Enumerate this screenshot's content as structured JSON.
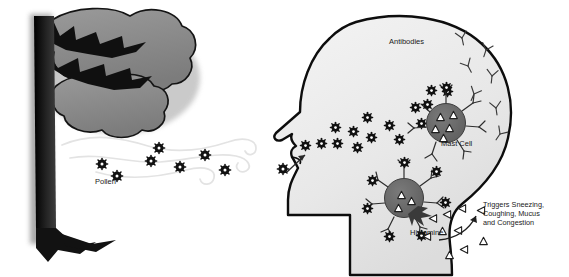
{
  "diagram": {
    "type": "biological-process-illustration",
    "canvas": {
      "width": 569,
      "height": 277,
      "background": "#ffffff"
    },
    "labels": {
      "pollen": "Pollen",
      "antibodies": "Antibodies",
      "mast_cell": "Mast Cell",
      "histamine": "Histamine",
      "triggers": "Triggers Sneezing,\nCoughing, Mucus\nand Congestion"
    },
    "colors": {
      "outline": "#111111",
      "tree_trunk": "#1c1c1c",
      "tree_foliage": "#8a8a8a",
      "head_fill": "#ececec",
      "head_outline": "#0d0d0d",
      "mast_cell_fill": "#666666",
      "pollen_fill": "#111111",
      "pollen_core": "#ffffff",
      "antibody_stroke": "#333333",
      "histamine_stroke": "#222222",
      "wind_stroke": "#e2e2e2",
      "text": "#1a1a1a"
    },
    "elements": {
      "tree": {
        "name": "pollen-producing-tree",
        "trunk_x": 42,
        "foliage_clouds": 2
      },
      "wind_streams": 3,
      "airborne_pollen_count": 8,
      "head": {
        "profile": "left-facing human head and neck",
        "nose_entry_arrow": true
      },
      "free_antibodies_count": 6,
      "mast_cells": [
        {
          "id": "upper-mast-cell",
          "cx": 446,
          "cy": 123,
          "r": 20,
          "bound_pollen": 2,
          "granules": 5,
          "degranulating": false
        },
        {
          "id": "lower-mast-cell",
          "cx": 404,
          "cy": 198,
          "r": 20,
          "bound_pollen": 7,
          "granules": 3,
          "degranulating": true
        }
      ],
      "inhaled_pollen_count": 14,
      "released_histamine_count": 10,
      "outcome_arrow": "curved arrow from histamine cloud to outcome text"
    }
  }
}
